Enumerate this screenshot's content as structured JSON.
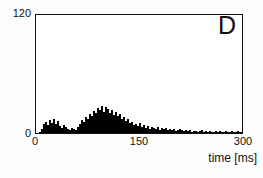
{
  "figure": {
    "panel_letter": "D",
    "background_color": "#ffffff",
    "bar_color": "#1a1a1a",
    "axis_color": "#111111"
  },
  "chart_data": {
    "type": "bar",
    "title": "",
    "subtitle": "",
    "panel_label": "D",
    "xlabel": "time [ms]",
    "ylabel": "",
    "xlim": [
      0,
      300
    ],
    "ylim": [
      0,
      120
    ],
    "xticks": [
      0,
      150,
      300
    ],
    "xtick_labels": [
      "0",
      "150",
      "300"
    ],
    "yticks": [
      0,
      120
    ],
    "ytick_labels": [
      "0",
      "120"
    ],
    "grid": false,
    "legend": null,
    "bin_width_ms": 2,
    "bin_count": 150,
    "x": [
      1,
      3,
      5,
      7,
      9,
      11,
      13,
      15,
      17,
      19,
      21,
      23,
      25,
      27,
      29,
      31,
      33,
      35,
      37,
      39,
      41,
      43,
      45,
      47,
      49,
      51,
      53,
      55,
      57,
      59,
      61,
      63,
      65,
      67,
      69,
      71,
      73,
      75,
      77,
      79,
      81,
      83,
      85,
      87,
      89,
      91,
      93,
      95,
      97,
      99,
      101,
      103,
      105,
      107,
      109,
      111,
      113,
      115,
      117,
      119,
      121,
      123,
      125,
      127,
      129,
      131,
      133,
      135,
      137,
      139,
      141,
      143,
      145,
      147,
      149,
      151,
      153,
      155,
      157,
      159,
      161,
      163,
      165,
      167,
      169,
      171,
      173,
      175,
      177,
      179,
      181,
      183,
      185,
      187,
      189,
      191,
      193,
      195,
      197,
      199,
      201,
      203,
      205,
      207,
      209,
      211,
      213,
      215,
      217,
      219,
      221,
      223,
      225,
      227,
      229,
      231,
      233,
      235,
      237,
      239,
      241,
      243,
      245,
      247,
      249,
      251,
      253,
      255,
      257,
      259,
      261,
      263,
      265,
      267,
      269,
      271,
      273,
      275,
      277,
      279,
      281,
      283,
      285,
      287,
      289,
      291,
      293,
      295,
      297,
      299
    ],
    "values": [
      0,
      0,
      1,
      4,
      9,
      11,
      8,
      13,
      10,
      14,
      9,
      12,
      7,
      5,
      8,
      6,
      4,
      3,
      5,
      4,
      3,
      6,
      9,
      13,
      11,
      16,
      14,
      19,
      17,
      22,
      20,
      25,
      23,
      27,
      21,
      26,
      24,
      20,
      23,
      18,
      21,
      17,
      19,
      14,
      16,
      12,
      14,
      10,
      11,
      8,
      9,
      7,
      10,
      6,
      8,
      5,
      7,
      4,
      6,
      5,
      4,
      6,
      3,
      5,
      4,
      5,
      3,
      4,
      3,
      4,
      2,
      3,
      4,
      3,
      2,
      3,
      2,
      3,
      1,
      2,
      2,
      1,
      2,
      3,
      1,
      2,
      1,
      2,
      1,
      1,
      2,
      1,
      2,
      1,
      1,
      2,
      1,
      1,
      2,
      1,
      1,
      2,
      1,
      1,
      1,
      2,
      1,
      1,
      2,
      1,
      1,
      1,
      2,
      1,
      1,
      1,
      2,
      1,
      1,
      1,
      1,
      2,
      1,
      1,
      1,
      1,
      2,
      1,
      1,
      1,
      1,
      1,
      2,
      1,
      1,
      1,
      1,
      2,
      1,
      1,
      1,
      1,
      1,
      2,
      1,
      1,
      1,
      1,
      1,
      1
    ]
  }
}
